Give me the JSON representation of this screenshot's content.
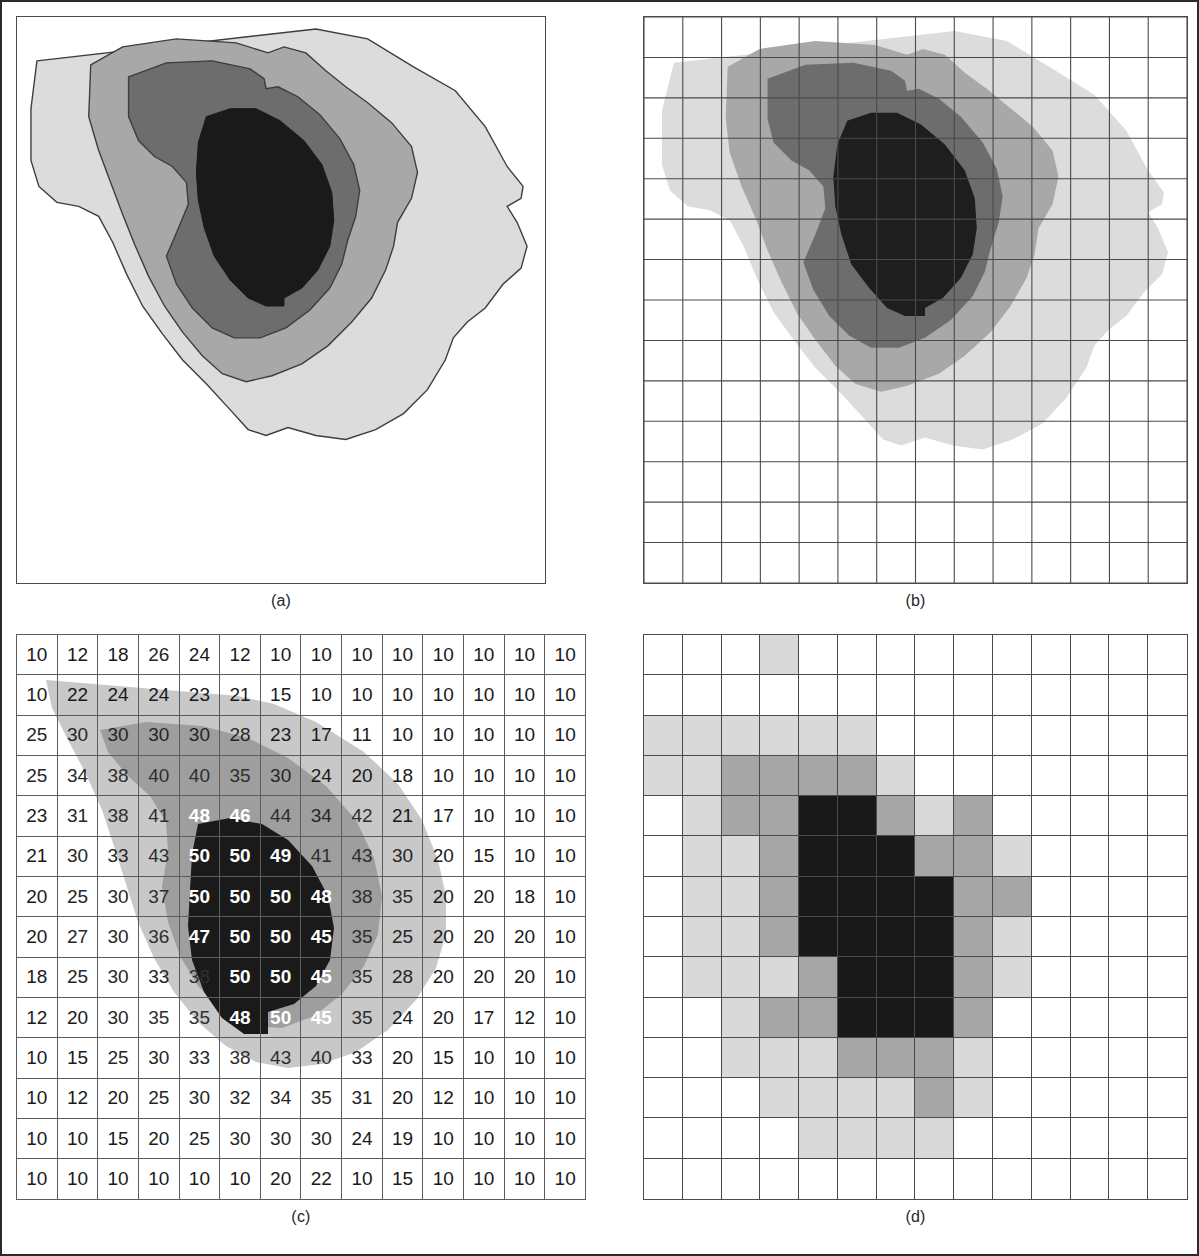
{
  "figure": {
    "background": "#ffffff",
    "border_color": "#2b2b2b"
  },
  "panels": [
    {
      "id": "a",
      "caption": "(a)",
      "description": "smooth contour map, four gray levels, no grid"
    },
    {
      "id": "b",
      "caption": "(b)",
      "description": "same contour map overlaid on a 14x14 cell grid"
    },
    {
      "id": "c",
      "caption": "(c)",
      "description": "14x14 table of numeric cell values shaded by contour class"
    },
    {
      "id": "d",
      "caption": "(d)",
      "description": "14x14 raster, each cell filled with its quantized gray level"
    }
  ],
  "palette": {
    "level_0_white": "#ffffff",
    "level_1_light_gray": "#d9d9d9",
    "level_2_mid_gray": "#a6a6a6",
    "level_3_dark_gray": "#6b6b6b",
    "level_4_black": "#191919",
    "contour_line": "#3a3a3a",
    "grid_line": "#4a4a4a",
    "panel_border": "#4a4a4a"
  },
  "legend_levels": [
    {
      "name": "white",
      "fill": "#ffffff",
      "value_range": "< 25"
    },
    {
      "name": "light gray",
      "fill": "#d9d9d9",
      "value_range": "25 - 34"
    },
    {
      "name": "mid gray",
      "fill": "#a6a6a6",
      "value_range": "35 - 44"
    },
    {
      "name": "black",
      "fill": "#191919",
      "value_range": ">= 45"
    }
  ],
  "chart_data": {
    "type": "heatmap",
    "xlabel": "",
    "ylabel": "",
    "rows": 14,
    "cols": 14,
    "vmin": 10,
    "vmax": 50,
    "grid": true,
    "legend_position": "none",
    "contour_levels": [
      25,
      35,
      45
    ],
    "values": [
      [
        10,
        12,
        18,
        26,
        24,
        12,
        10,
        10,
        10,
        10,
        10,
        10,
        10,
        10
      ],
      [
        10,
        22,
        24,
        24,
        23,
        21,
        15,
        10,
        10,
        10,
        10,
        10,
        10,
        10
      ],
      [
        25,
        30,
        30,
        30,
        30,
        28,
        23,
        17,
        11,
        10,
        10,
        10,
        10,
        10
      ],
      [
        25,
        34,
        38,
        40,
        40,
        35,
        30,
        24,
        20,
        18,
        10,
        10,
        10,
        10
      ],
      [
        23,
        31,
        38,
        41,
        48,
        46,
        44,
        34,
        42,
        21,
        17,
        10,
        10,
        10
      ],
      [
        21,
        30,
        33,
        43,
        50,
        50,
        49,
        41,
        43,
        30,
        20,
        15,
        10,
        10
      ],
      [
        20,
        25,
        30,
        37,
        50,
        50,
        50,
        48,
        38,
        35,
        20,
        20,
        18,
        10
      ],
      [
        20,
        27,
        30,
        36,
        47,
        50,
        50,
        45,
        35,
        25,
        20,
        20,
        20,
        10
      ],
      [
        18,
        25,
        30,
        33,
        38,
        50,
        50,
        45,
        35,
        28,
        20,
        20,
        20,
        10
      ],
      [
        12,
        20,
        30,
        35,
        35,
        48,
        50,
        45,
        35,
        24,
        20,
        17,
        12,
        10
      ],
      [
        10,
        15,
        25,
        30,
        33,
        38,
        43,
        40,
        33,
        20,
        15,
        10,
        10,
        10
      ],
      [
        10,
        12,
        20,
        25,
        30,
        32,
        34,
        35,
        31,
        20,
        12,
        10,
        10,
        10
      ],
      [
        10,
        10,
        15,
        20,
        25,
        30,
        30,
        30,
        24,
        19,
        10,
        10,
        10,
        10
      ],
      [
        10,
        10,
        10,
        10,
        10,
        10,
        20,
        22,
        10,
        15,
        10,
        10,
        10,
        10
      ]
    ],
    "quantized_levels": [
      [
        0,
        0,
        0,
        1,
        0,
        0,
        0,
        0,
        0,
        0,
        0,
        0,
        0,
        0
      ],
      [
        0,
        0,
        0,
        0,
        0,
        0,
        0,
        0,
        0,
        0,
        0,
        0,
        0,
        0
      ],
      [
        1,
        1,
        1,
        1,
        1,
        1,
        0,
        0,
        0,
        0,
        0,
        0,
        0,
        0
      ],
      [
        1,
        1,
        2,
        2,
        2,
        2,
        1,
        0,
        0,
        0,
        0,
        0,
        0,
        0
      ],
      [
        0,
        1,
        2,
        2,
        3,
        3,
        2,
        1,
        2,
        0,
        0,
        0,
        0,
        0
      ],
      [
        0,
        1,
        1,
        2,
        3,
        3,
        3,
        2,
        2,
        1,
        0,
        0,
        0,
        0
      ],
      [
        0,
        1,
        1,
        2,
        3,
        3,
        3,
        3,
        2,
        2,
        0,
        0,
        0,
        0
      ],
      [
        0,
        1,
        1,
        2,
        3,
        3,
        3,
        3,
        2,
        1,
        0,
        0,
        0,
        0
      ],
      [
        0,
        1,
        1,
        1,
        2,
        3,
        3,
        3,
        2,
        1,
        0,
        0,
        0,
        0
      ],
      [
        0,
        0,
        1,
        2,
        2,
        3,
        3,
        3,
        2,
        0,
        0,
        0,
        0,
        0
      ],
      [
        0,
        0,
        1,
        1,
        1,
        2,
        2,
        2,
        1,
        0,
        0,
        0,
        0,
        0
      ],
      [
        0,
        0,
        0,
        1,
        1,
        1,
        1,
        2,
        1,
        0,
        0,
        0,
        0,
        0
      ],
      [
        0,
        0,
        0,
        0,
        1,
        1,
        1,
        1,
        0,
        0,
        0,
        0,
        0,
        0
      ],
      [
        0,
        0,
        0,
        0,
        0,
        0,
        0,
        0,
        0,
        0,
        0,
        0,
        0,
        0
      ]
    ]
  }
}
